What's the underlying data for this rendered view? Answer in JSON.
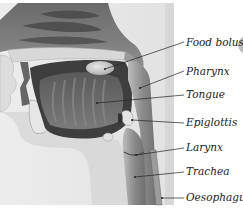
{
  "diagram": {
    "labels": [
      {
        "id": "food-bolus",
        "text": "Food bolus",
        "x": 186,
        "y": 37,
        "pointer": {
          "x1": 105,
          "y1": 69,
          "x2": 184,
          "y2": 42
        }
      },
      {
        "id": "pharynx",
        "text": "Pharynx",
        "x": 186,
        "y": 66,
        "pointer": {
          "x1": 140,
          "y1": 88,
          "x2": 184,
          "y2": 71
        }
      },
      {
        "id": "tongue",
        "text": "Tongue",
        "x": 186,
        "y": 89,
        "pointer": {
          "x1": 97,
          "y1": 103,
          "x2": 184,
          "y2": 95
        }
      },
      {
        "id": "epiglottis",
        "text": "Epiglottis",
        "x": 186,
        "y": 117,
        "pointer": {
          "x1": 132,
          "y1": 120,
          "x2": 184,
          "y2": 123
        }
      },
      {
        "id": "larynx",
        "text": "Larynx",
        "x": 186,
        "y": 142,
        "pointer": {
          "x1": 136,
          "y1": 155,
          "x2": 184,
          "y2": 148
        }
      },
      {
        "id": "trachea",
        "text": "Trachea",
        "x": 186,
        "y": 166,
        "pointer": {
          "x1": 135,
          "y1": 177,
          "x2": 184,
          "y2": 172
        }
      },
      {
        "id": "oesophagus",
        "text": "Oesophagus",
        "x": 186,
        "y": 192,
        "pointer": {
          "x1": 162,
          "y1": 198,
          "x2": 184,
          "y2": 198
        }
      }
    ]
  }
}
